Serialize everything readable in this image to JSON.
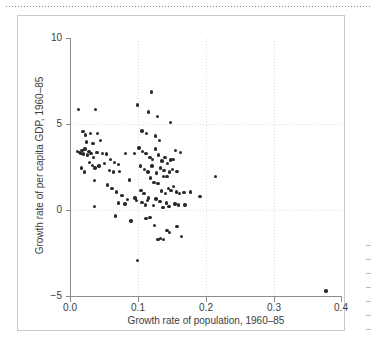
{
  "figure": {
    "background_color": "#ffffff",
    "frame_color": "#c9c9c9",
    "point_color": "#2a2a2a",
    "axis_color": "#8d8d8d",
    "grid_color": "#dcdcdc"
  },
  "chart_data": {
    "type": "scatter",
    "title": "",
    "xlabel": "Growth rate of population, 1960–85",
    "ylabel": "Growth rate of per capita GDP, 1960–85",
    "xlim": [
      0.0,
      0.4
    ],
    "ylim": [
      -5,
      10
    ],
    "xticks": [
      "0.0",
      "0.1",
      "0.2",
      "0.3",
      "0.4"
    ],
    "xtick_values": [
      0.0,
      0.1,
      0.2,
      0.3,
      0.4
    ],
    "yticks": [
      "10",
      "5",
      "0",
      "−5"
    ],
    "ytick_values": [
      10,
      5,
      0,
      -5
    ],
    "grid": true,
    "grid_style": "dotted",
    "legend": "none",
    "marker": "circle",
    "n_points": 122,
    "points": [
      [
        0.013,
        5.85
      ],
      [
        0.038,
        5.85
      ],
      [
        0.1,
        6.1
      ],
      [
        0.12,
        6.85
      ],
      [
        0.116,
        5.7
      ],
      [
        0.129,
        5.45
      ],
      [
        0.148,
        5.1
      ],
      [
        0.019,
        4.55
      ],
      [
        0.023,
        4.35
      ],
      [
        0.03,
        4.45
      ],
      [
        0.041,
        4.45
      ],
      [
        0.106,
        4.6
      ],
      [
        0.113,
        4.45
      ],
      [
        0.126,
        4.3
      ],
      [
        0.132,
        4.05
      ],
      [
        0.024,
        3.95
      ],
      [
        0.034,
        3.85
      ],
      [
        0.045,
        4.05
      ],
      [
        0.011,
        3.4
      ],
      [
        0.014,
        3.35
      ],
      [
        0.016,
        3.3
      ],
      [
        0.018,
        3.45
      ],
      [
        0.02,
        3.25
      ],
      [
        0.022,
        3.55
      ],
      [
        0.026,
        3.2
      ],
      [
        0.028,
        3.4
      ],
      [
        0.031,
        3.3
      ],
      [
        0.035,
        3.05
      ],
      [
        0.04,
        3.35
      ],
      [
        0.048,
        3.3
      ],
      [
        0.054,
        3.25
      ],
      [
        0.06,
        2.95
      ],
      [
        0.066,
        2.75
      ],
      [
        0.072,
        2.65
      ],
      [
        0.082,
        3.3
      ],
      [
        0.095,
        3.3
      ],
      [
        0.102,
        3.6
      ],
      [
        0.107,
        3.4
      ],
      [
        0.112,
        3.3
      ],
      [
        0.118,
        3.05
      ],
      [
        0.122,
        2.95
      ],
      [
        0.126,
        3.55
      ],
      [
        0.131,
        3.2
      ],
      [
        0.136,
        2.85
      ],
      [
        0.14,
        3.05
      ],
      [
        0.144,
        2.7
      ],
      [
        0.148,
        2.9
      ],
      [
        0.152,
        2.95
      ],
      [
        0.156,
        3.45
      ],
      [
        0.163,
        3.35
      ],
      [
        0.017,
        2.45
      ],
      [
        0.021,
        2.2
      ],
      [
        0.029,
        2.75
      ],
      [
        0.033,
        2.6
      ],
      [
        0.037,
        2.45
      ],
      [
        0.043,
        2.55
      ],
      [
        0.051,
        2.7
      ],
      [
        0.058,
        2.3
      ],
      [
        0.064,
        2.2
      ],
      [
        0.073,
        2.25
      ],
      [
        0.104,
        2.55
      ],
      [
        0.11,
        2.35
      ],
      [
        0.115,
        2.2
      ],
      [
        0.121,
        2.55
      ],
      [
        0.128,
        2.15
      ],
      [
        0.134,
        2.45
      ],
      [
        0.139,
        2.3
      ],
      [
        0.143,
        1.95
      ],
      [
        0.147,
        2.2
      ],
      [
        0.151,
        2.35
      ],
      [
        0.158,
        2.25
      ],
      [
        0.215,
        1.95
      ],
      [
        0.036,
        1.7
      ],
      [
        0.055,
        1.45
      ],
      [
        0.062,
        1.25
      ],
      [
        0.069,
        1.05
      ],
      [
        0.077,
        0.85
      ],
      [
        0.088,
        1.75
      ],
      [
        0.096,
        0.7
      ],
      [
        0.105,
        1.15
      ],
      [
        0.109,
        0.95
      ],
      [
        0.114,
        0.55
      ],
      [
        0.119,
        1.85
      ],
      [
        0.124,
        1.6
      ],
      [
        0.13,
        1.55
      ],
      [
        0.135,
        1.1
      ],
      [
        0.138,
        1.95
      ],
      [
        0.141,
        0.95
      ],
      [
        0.145,
        1.25
      ],
      [
        0.149,
        1.15
      ],
      [
        0.153,
        1.35
      ],
      [
        0.157,
        1.05
      ],
      [
        0.162,
        0.95
      ],
      [
        0.168,
        1.0
      ],
      [
        0.178,
        1.05
      ],
      [
        0.192,
        0.8
      ],
      [
        0.036,
        0.2
      ],
      [
        0.072,
        0.4
      ],
      [
        0.081,
        0.35
      ],
      [
        0.085,
        0.6
      ],
      [
        0.098,
        0.55
      ],
      [
        0.106,
        0.45
      ],
      [
        0.111,
        0.3
      ],
      [
        0.116,
        0.7
      ],
      [
        0.123,
        0.25
      ],
      [
        0.127,
        0.65
      ],
      [
        0.133,
        0.5
      ],
      [
        0.137,
        0.15
      ],
      [
        0.142,
        0.4
      ],
      [
        0.146,
        0.2
      ],
      [
        0.155,
        0.35
      ],
      [
        0.16,
        0.3
      ],
      [
        0.17,
        0.3
      ],
      [
        0.067,
        -0.35
      ],
      [
        0.09,
        -0.65
      ],
      [
        0.112,
        -0.5
      ],
      [
        0.118,
        -0.45
      ],
      [
        0.125,
        -0.9
      ],
      [
        0.13,
        -1.7
      ],
      [
        0.134,
        -1.65
      ],
      [
        0.138,
        -1.7
      ],
      [
        0.143,
        -1.2
      ],
      [
        0.147,
        -1.3
      ],
      [
        0.158,
        -0.95
      ],
      [
        0.165,
        -1.55
      ],
      [
        0.1,
        -2.95
      ],
      [
        0.378,
        -4.7
      ]
    ]
  },
  "annotations": {
    "top_rule": "dotted-rule"
  }
}
